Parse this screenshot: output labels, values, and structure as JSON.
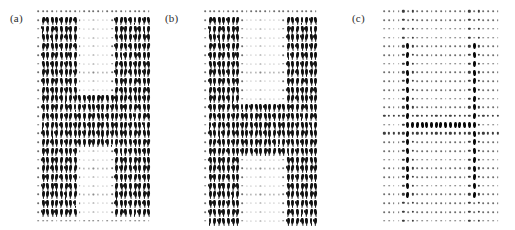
{
  "figure": {
    "width": 515,
    "height": 230,
    "background": "#ffffff",
    "glyph_color": "#111111",
    "dot_color": "#6e6e6e"
  },
  "panels": [
    {
      "id": "a",
      "label": "(a)",
      "label_x": 10,
      "label_y": 12,
      "grid_x": 36,
      "grid_y": 7,
      "grid_w": 115,
      "grid_h": 218,
      "cols": 25,
      "rows": 25,
      "description": "dense-arrow-field-inside-H",
      "inside_glyph": "arrow",
      "outside_glyph": "tiny-dot",
      "h_shape": {
        "left_stroke_cols": [
          1,
          8
        ],
        "right_stroke_cols": [
          17,
          24
        ],
        "crossbar_rows": [
          10,
          15
        ],
        "top_row": 1,
        "bottom_row": 23
      }
    },
    {
      "id": "b",
      "label": "(b)",
      "label_x": 165,
      "label_y": 12,
      "grid_x": 203,
      "grid_y": 7,
      "grid_w": 115,
      "grid_h": 218,
      "cols": 25,
      "rows": 25,
      "description": "dense-arrow-field-inside-H-shifted-crossbar",
      "inside_glyph": "arrow",
      "outside_glyph": "tiny-dot",
      "h_shape": {
        "left_stroke_cols": [
          1,
          7
        ],
        "right_stroke_cols": [
          18,
          24
        ],
        "crossbar_rows": [
          11,
          16
        ],
        "top_row": 1,
        "bottom_row": 24
      }
    },
    {
      "id": "c",
      "label": "(c)",
      "label_x": 352,
      "label_y": 12,
      "grid_x": 382,
      "grid_y": 7,
      "grid_w": 118,
      "grid_h": 218,
      "cols": 25,
      "rows": 25,
      "description": "sparse-dot-field-with-large-edge-markers",
      "inside_glyph": "small-dot",
      "outside_glyph": "tiny-dot",
      "edge_glyph": "large-dot",
      "h_shape": {
        "left_edge_col": 5,
        "right_edge_col": 19,
        "crossbar_row": 13,
        "edge_top_row": 4,
        "edge_bottom_row": 21
      }
    }
  ],
  "chart_data": {
    "type": "heatmap",
    "title": "",
    "xlabel": "",
    "ylabel": "",
    "panel_labels": [
      "(a)",
      "(b)",
      "(c)"
    ],
    "grid_cols": 25,
    "grid_rows": 25,
    "marker_levels": [
      "tiny",
      "small",
      "mid",
      "big"
    ],
    "legend_position": "none",
    "grid": false
  }
}
